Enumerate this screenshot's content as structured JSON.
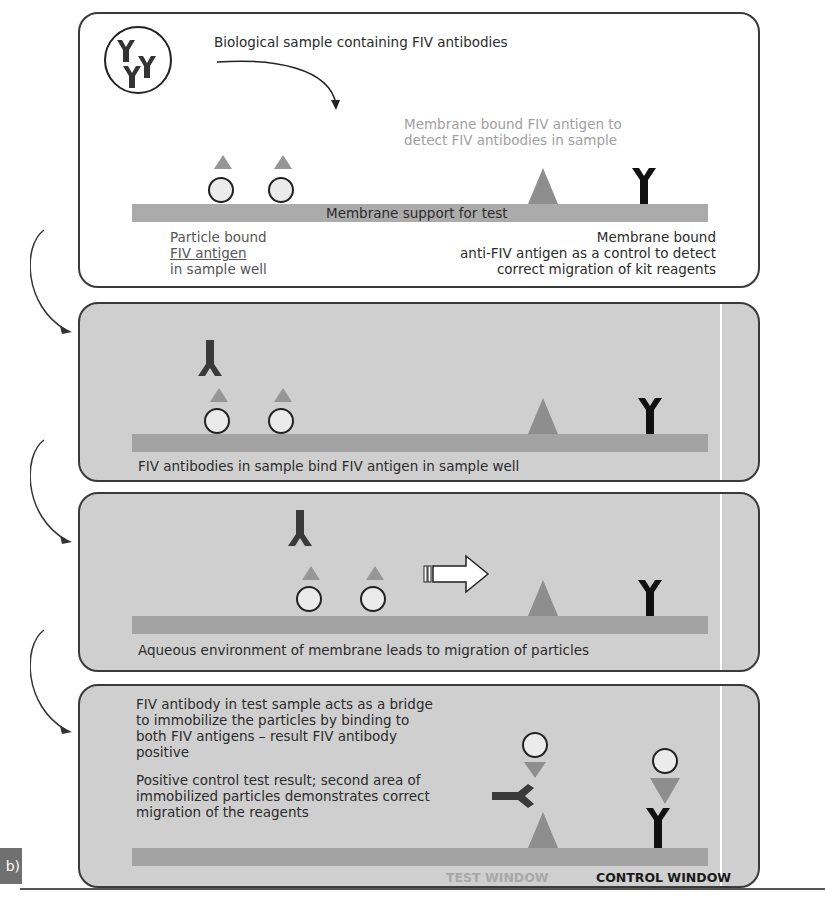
{
  "figure": {
    "step_label": "b)",
    "colors": {
      "panel_grey": "#cfcfcf",
      "membrane": "#a3a3a3",
      "antigen": "#8e8e8e",
      "antibody_sample": "#3a3a3a",
      "antibody_control": "#111111",
      "particle_fill": "#ebebeb",
      "grey_label": "#a0a0a0"
    }
  },
  "panel1": {
    "sample_label": "Biological sample containing FIV antibodies",
    "sample_icon": "antibodies-in-circle-icon",
    "membrane_antigen_label_line1": "Membrane bound FIV antigen to",
    "membrane_antigen_label_line2": "detect FIV antibodies in sample",
    "membrane_label": "Membrane support for test",
    "particle_label_line1": "Particle bound",
    "particle_label_line2": "FIV antigen",
    "particle_label_line3": "in sample well",
    "control_label_line1": "Membrane bound",
    "control_label_line2": "anti-FIV antigen as a control to detect",
    "control_label_line3": "correct migration of kit reagents"
  },
  "panel2": {
    "caption": "FIV antibodies in sample bind FIV antigen in sample well"
  },
  "panel3": {
    "caption": "Aqueous environment of membrane leads to migration of particles",
    "arrow_icon": "migration-arrow-icon"
  },
  "panel4": {
    "text1_line1": "FIV antibody in test sample acts as a bridge",
    "text1_line2": "to immobilize the particles by binding to",
    "text1_line3": "both FIV antigens – result FIV antibody",
    "text1_line4": "positive",
    "text2_line1": "Positive control test result; second area of",
    "text2_line2": "immobilized particles demonstrates correct",
    "text2_line3": "migration of the reagents",
    "test_window_label": "TEST WINDOW",
    "control_window_label": "CONTROL WINDOW"
  }
}
